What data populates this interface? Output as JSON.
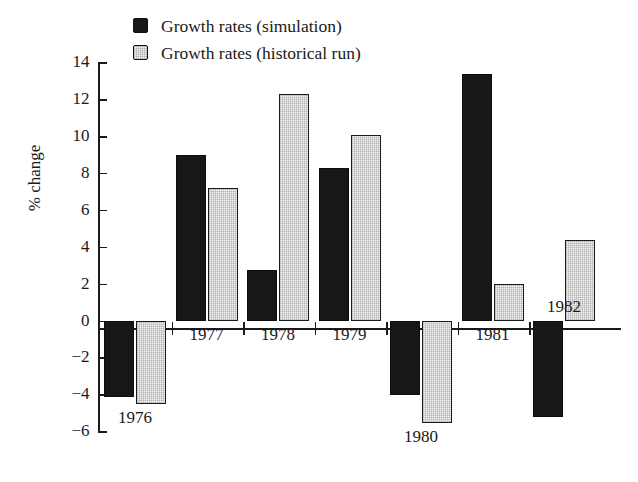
{
  "chart_data": {
    "type": "bar",
    "title": "",
    "xlabel": "",
    "ylabel": "% change",
    "ylim": [
      -6,
      14
    ],
    "yticks": [
      14,
      12,
      10,
      8,
      6,
      4,
      2,
      0,
      -2,
      -4,
      -6
    ],
    "ytick_labels": [
      "14",
      "12",
      "10",
      "8",
      "6",
      "4",
      "2",
      "0",
      "−2",
      "−4",
      "−6"
    ],
    "grid": false,
    "legend_position": "top-left",
    "categories": [
      "1976",
      "1977",
      "1978",
      "1979",
      "1980",
      "1981",
      "1982"
    ],
    "series": [
      {
        "name": "Growth rates (simulation)",
        "color": "#171717",
        "values": [
          -4.1,
          9.0,
          2.8,
          8.3,
          -4.0,
          13.4,
          -5.2
        ]
      },
      {
        "name": "Growth rates (historical run)",
        "color": "#f2f2f2",
        "values": [
          -4.5,
          7.2,
          12.3,
          10.1,
          -5.5,
          2.0,
          4.4
        ]
      }
    ]
  },
  "legend": {
    "items": [
      {
        "label": "Growth rates (simulation)",
        "swatch": "dark"
      },
      {
        "label": "Growth rates (historical run)",
        "swatch": "light"
      }
    ]
  },
  "axis": {
    "y_title": "% change"
  },
  "colors": {
    "dark_bar": "#171717",
    "light_bar": "#f2f2f2",
    "axis": "#1a1a1a",
    "background": "#ffffff"
  }
}
